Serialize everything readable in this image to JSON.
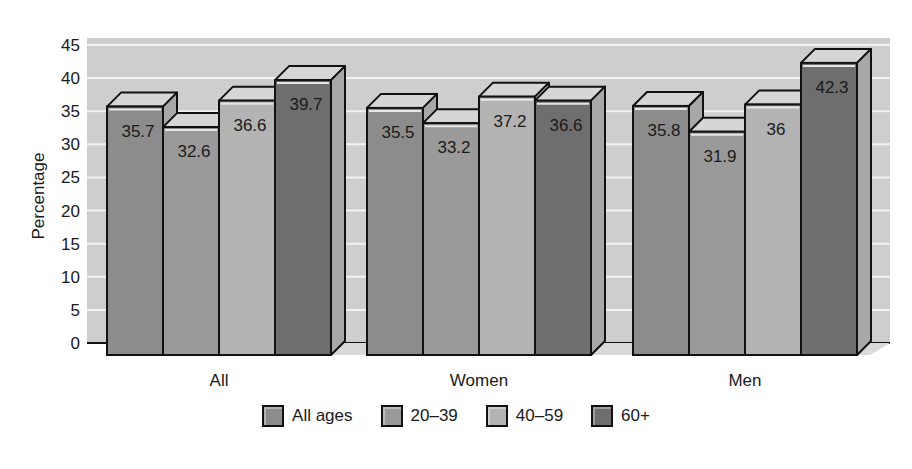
{
  "chart_data": {
    "type": "bar",
    "title": "",
    "xlabel": "",
    "ylabel": "Percentage",
    "ylim": [
      0,
      45
    ],
    "yticks": [
      0,
      5,
      10,
      15,
      20,
      25,
      30,
      35,
      40,
      45
    ],
    "grid": true,
    "legend_position": "bottom",
    "categories": [
      "All",
      "Women",
      "Men"
    ],
    "series": [
      {
        "name": "All ages",
        "values": [
          35.7,
          35.5,
          35.8
        ],
        "color": "#8c8c8c"
      },
      {
        "name": "20–39",
        "values": [
          32.6,
          33.2,
          31.9
        ],
        "color": "#9a9a9a"
      },
      {
        "name": "40–59",
        "values": [
          36.6,
          37.2,
          36
        ],
        "color": "#b3b3b3"
      },
      {
        "name": "60+",
        "values": [
          39.7,
          36.6,
          42.3
        ],
        "color": "#6e6e6e"
      }
    ],
    "value_labels": [
      [
        "35.7",
        "32.6",
        "36.6",
        "39.7"
      ],
      [
        "35.5",
        "33.2",
        "37.2",
        "36.6"
      ],
      [
        "35.8",
        "31.9",
        "36",
        "42.3"
      ]
    ]
  },
  "legend": {
    "items": [
      {
        "label": "All ages",
        "color": "#8c8c8c"
      },
      {
        "label": "20–39",
        "color": "#9a9a9a"
      },
      {
        "label": "40–59",
        "color": "#b3b3b3"
      },
      {
        "label": "60+",
        "color": "#6e6e6e"
      }
    ]
  }
}
